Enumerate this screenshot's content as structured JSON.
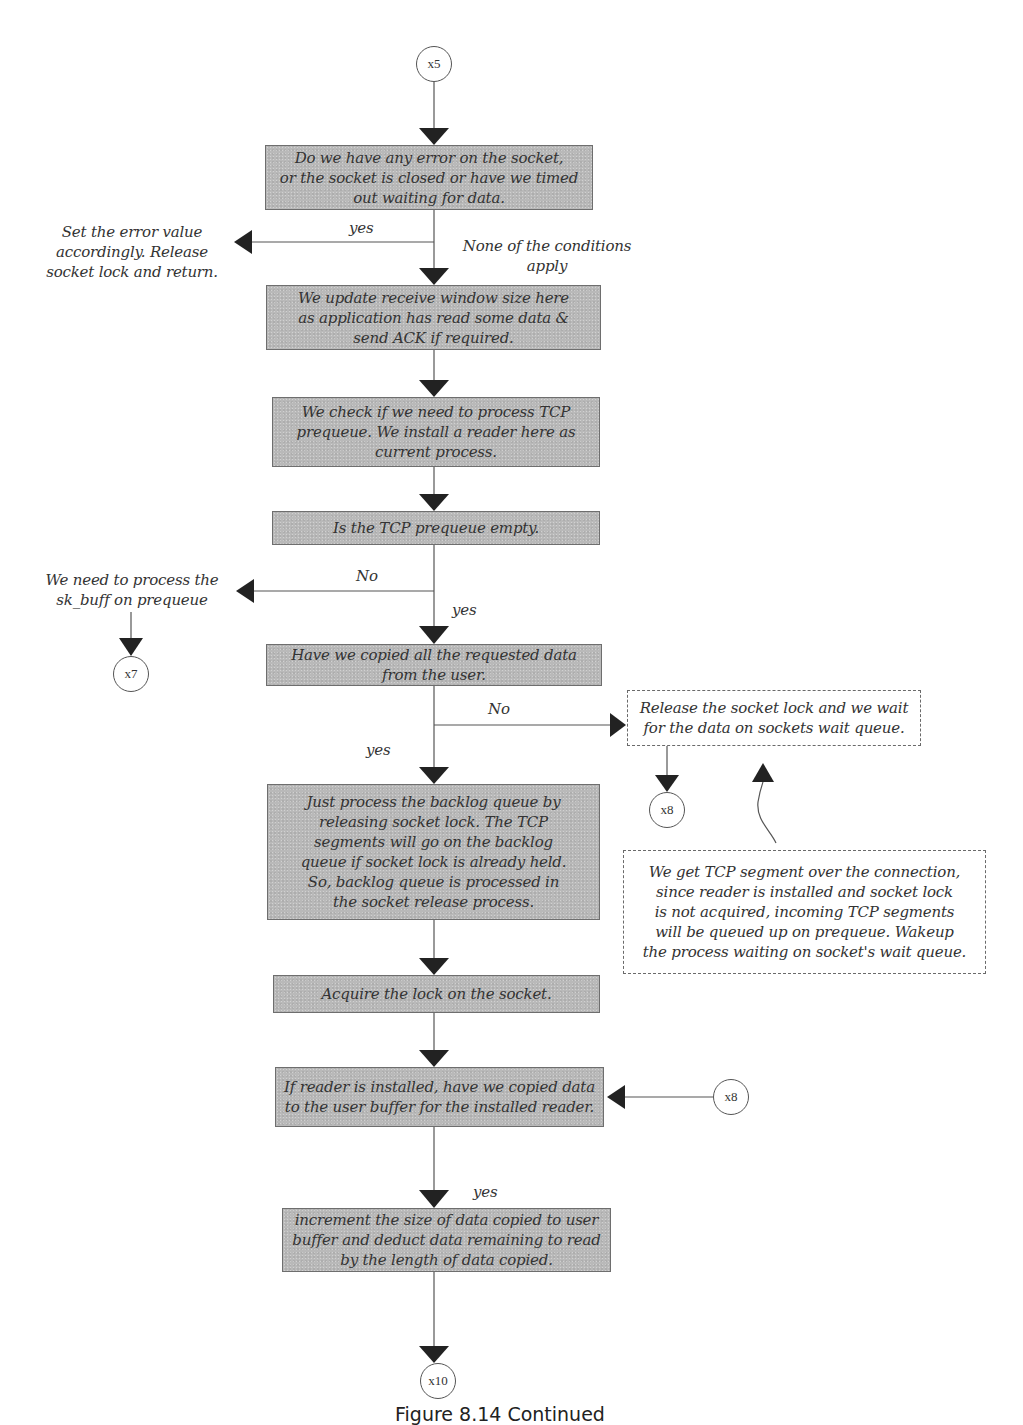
{
  "diagram": {
    "type": "flowchart",
    "connectors": {
      "x5_top": "x5",
      "x7": "x7",
      "x8_wait": "x8",
      "x8_right": "x8",
      "x10": "x10"
    },
    "process_boxes": [
      {
        "id": "check_error",
        "text": "Do we have any error on the socket,\nor the socket is closed or have we timed\nout waiting for data."
      },
      {
        "id": "update_window",
        "text": "We update receive window size here\nas application has read some data &\nsend ACK if required."
      },
      {
        "id": "check_prequeue",
        "text": "We check if we need to process TCP\nprequeue. We install a reader here as\ncurrent process."
      },
      {
        "id": "prequeue_empty",
        "text": "Is the TCP prequeue empty."
      },
      {
        "id": "copied_all",
        "text": "Have we copied all the requested data\nfrom the user."
      },
      {
        "id": "process_backlog",
        "text": "Just process the backlog queue by\nreleasing socket lock. The TCP\nsegments will go on the backlog\nqueue if socket lock is already held.\nSo, backlog queue is processed in\nthe socket release process."
      },
      {
        "id": "acquire_lock",
        "text": "Acquire the lock on the socket."
      },
      {
        "id": "reader_copied",
        "text": "If reader is installed, have we copied data\nto the user buffer for the installed reader."
      },
      {
        "id": "increment_size",
        "text": "increment the size of data copied to user\nbuffer and deduct data remaining to read\nby the length of data copied."
      }
    ],
    "dashed_boxes": [
      {
        "id": "release_wait",
        "text": "Release the socket lock and we wait\nfor the data on sockets wait queue."
      },
      {
        "id": "tcp_segment_note",
        "text": "We get TCP segment over the connection,\nsince reader is installed and socket lock\nis not acquired, incoming TCP segments\nwill be queued up on prequeue. Wakeup\nthe  process waiting on socket's wait queue."
      }
    ],
    "side_notes": {
      "set_error": "Set the error value\naccordingly. Release\nsocket lock and return.",
      "process_skbuff": "We need to process the\nsk_buff on prequeue"
    },
    "edge_labels": {
      "error_yes": "yes",
      "none_apply": "None of the conditions\napply",
      "prequeue_no": "No",
      "prequeue_yes": "yes",
      "copied_no": "No",
      "copied_yes": "yes",
      "reader_yes": "yes"
    },
    "colors": {
      "box_fill": "#b9b9b9",
      "box_border": "#6e6e6e",
      "line": "#555555",
      "arrowhead": "#222222",
      "text": "#333333"
    }
  },
  "caption": "Figure 8.14 Continued"
}
